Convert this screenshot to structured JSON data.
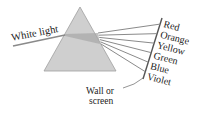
{
  "diagram": {
    "input_label": "White light",
    "screen_label_line1": "Wall or",
    "screen_label_line2": "screen",
    "colors": [
      {
        "name": "Red",
        "hex": "#888888"
      },
      {
        "name": "Orange",
        "hex": "#888888"
      },
      {
        "name": "Yellow",
        "hex": "#888888"
      },
      {
        "name": "Green",
        "hex": "#888888"
      },
      {
        "name": "Blue",
        "hex": "#888888"
      },
      {
        "name": "Violet",
        "hex": "#888888"
      }
    ],
    "prism_fill": "#c8c8c8",
    "prism_stroke": "#9a9a9a",
    "ray_color": "#8a8a8a",
    "screen_color": "#555555"
  }
}
